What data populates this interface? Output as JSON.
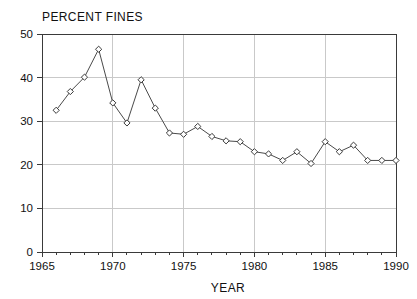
{
  "chart_data": {
    "type": "line",
    "title": "PERCENT FINES",
    "subtitle": "",
    "xlabel": "YEAR",
    "ylabel": "",
    "xlim": [
      1965,
      1990
    ],
    "ylim": [
      0,
      50
    ],
    "grid": true,
    "legend_position": "none",
    "marker": "diamond-open",
    "line_color": "#4a4a4a",
    "marker_fill": "#ffffff",
    "marker_edge": "#3a3a3a",
    "background_color": "#ffffff",
    "grid_color": "#c9c9c9",
    "axis_color": "#3a3a3a",
    "x_ticks": [
      1965,
      1970,
      1975,
      1980,
      1985,
      1990
    ],
    "x_tick_labels": [
      "1965",
      "1970",
      "1975",
      "1980",
      "1985",
      "1990"
    ],
    "x_minor_ticks": [
      1966,
      1967,
      1968,
      1969,
      1971,
      1972,
      1973,
      1974,
      1976,
      1977,
      1978,
      1979,
      1981,
      1982,
      1983,
      1984,
      1986,
      1987,
      1988,
      1989
    ],
    "y_ticks": [
      0,
      10,
      20,
      30,
      40,
      50
    ],
    "y_tick_labels": [
      "0",
      "10",
      "20",
      "30",
      "40",
      "50"
    ],
    "x": [
      1966,
      1967,
      1968,
      1969,
      1970,
      1971,
      1972,
      1973,
      1974,
      1975,
      1976,
      1977,
      1978,
      1979,
      1980,
      1981,
      1982,
      1983,
      1984,
      1985,
      1986,
      1987,
      1988,
      1989,
      1990
    ],
    "values": [
      32.5,
      36.8,
      40.1,
      46.5,
      34.2,
      29.6,
      39.5,
      33.0,
      27.3,
      27.0,
      28.8,
      26.5,
      25.5,
      25.3,
      23.0,
      22.5,
      21.0,
      23.0,
      20.3,
      25.3,
      23.0,
      24.5,
      21.0,
      21.0,
      21.0
    ],
    "series": [
      {
        "name": "Percent fines",
        "values": [
          32.5,
          36.8,
          40.1,
          46.5,
          34.2,
          29.6,
          39.5,
          33.0,
          27.3,
          27.0,
          28.8,
          26.5,
          25.5,
          25.3,
          23.0,
          22.5,
          21.0,
          23.0,
          20.3,
          25.3,
          23.0,
          24.5,
          21.0,
          21.0,
          21.0
        ]
      }
    ]
  }
}
